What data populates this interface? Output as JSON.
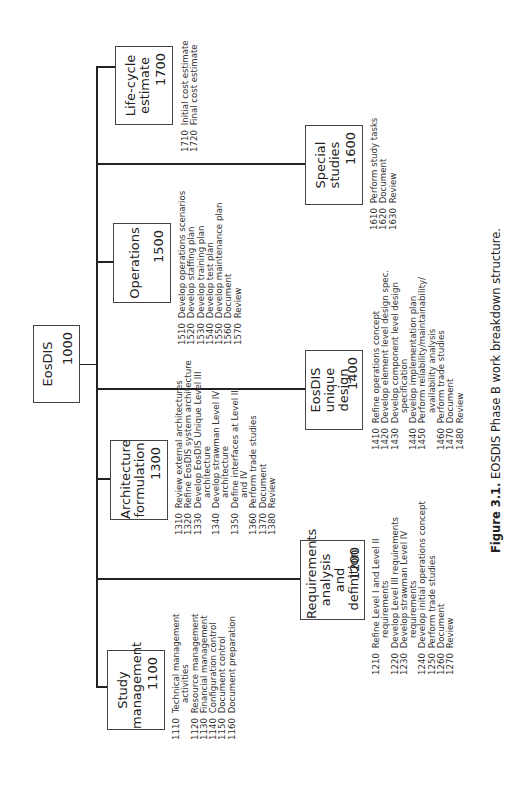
{
  "root": {
    "title": "EosDIS",
    "code": "1000"
  },
  "elements": [
    {
      "key": "study-management",
      "title": "Study\nmanagement",
      "code": "1100",
      "tasks": [
        {
          "num": "1110",
          "text": "Technical management",
          "cont": "activities"
        },
        {
          "num": "1120",
          "text": "Resource management"
        },
        {
          "num": "1130",
          "text": "Financial management"
        },
        {
          "num": "1140",
          "text": "Configuration control"
        },
        {
          "num": "1150",
          "text": "Document control"
        },
        {
          "num": "1160",
          "text": "Document preparation"
        }
      ]
    },
    {
      "key": "requirements-analysis",
      "title": "Requirements\nanalysis and\ndefinition",
      "code": "1200",
      "tasks": [
        {
          "num": "1210",
          "text": "Refine Level I and Level II",
          "cont": "requirements"
        },
        {
          "num": "1220",
          "text": "Develop Level III requirements"
        },
        {
          "num": "1230",
          "text": "Develop strawman Level IV",
          "cont": "requirements"
        },
        {
          "num": "1240",
          "text": "Develop initial operations concept"
        },
        {
          "num": "1250",
          "text": "Perform trade studies"
        },
        {
          "num": "1260",
          "text": "Document"
        },
        {
          "num": "1270",
          "text": "Review"
        }
      ]
    },
    {
      "key": "architecture-formulation",
      "title": "Architecture\nformulation",
      "code": "1300",
      "tasks": [
        {
          "num": "1310",
          "text": "Review external architectures"
        },
        {
          "num": "1320",
          "text": "Refine EosDIS system architecture"
        },
        {
          "num": "1330",
          "text": "Develop EosDIS Unique Level III",
          "cont": "architecture"
        },
        {
          "num": "1340",
          "text": "Develop strawman Level IV",
          "cont": "architecture"
        },
        {
          "num": "1350",
          "text": "Define interfaces at Level III",
          "cont": "and IV"
        },
        {
          "num": "1360",
          "text": "Perform trade studies"
        },
        {
          "num": "1370",
          "text": "Document"
        },
        {
          "num": "1380",
          "text": "Review"
        }
      ]
    },
    {
      "key": "eosdis-unique-design",
      "title": "EosDIS\nunique\ndesign",
      "code": "1400",
      "tasks": [
        {
          "num": "1410",
          "text": "Refine operations concept"
        },
        {
          "num": "1420",
          "text": "Develop element level design spec."
        },
        {
          "num": "1430",
          "text": "Develop component level design",
          "cont": "specification"
        },
        {
          "num": "1440",
          "text": "Develop implementation plan"
        },
        {
          "num": "1450",
          "text": "Perform reliability/maintainability/",
          "cont": "availability analysis"
        },
        {
          "num": "1460",
          "text": "Perform trade studies"
        },
        {
          "num": "1470",
          "text": "Document"
        },
        {
          "num": "1480",
          "text": "Review"
        }
      ]
    },
    {
      "key": "operations",
      "title": "Operations",
      "code": "1500",
      "tasks": [
        {
          "num": "1510",
          "text": "Develop operations scenarios"
        },
        {
          "num": "1520",
          "text": "Develop staffing plan"
        },
        {
          "num": "1530",
          "text": "Develop training plan"
        },
        {
          "num": "1540",
          "text": "Develop test plan"
        },
        {
          "num": "1550",
          "text": "Develop maintenance plan"
        },
        {
          "num": "1560",
          "text": "Document"
        },
        {
          "num": "1570",
          "text": "Review"
        }
      ]
    },
    {
      "key": "special-studies",
      "title": "Special\nstudies",
      "code": "1600",
      "tasks": [
        {
          "num": "1610",
          "text": "Perform study tasks"
        },
        {
          "num": "1620",
          "text": "Document"
        },
        {
          "num": "1630",
          "text": "Review"
        }
      ]
    },
    {
      "key": "life-cycle-estimate",
      "title": "Life-cycle\nestimate",
      "code": "1700",
      "tasks": [
        {
          "num": "1710",
          "text": "Initial cost estimate"
        },
        {
          "num": "1720",
          "text": "Final cost estimate"
        }
      ]
    }
  ],
  "caption": {
    "label": "Figure 3.1.",
    "text": "EOSDIS Phase B work breakdown structure."
  }
}
